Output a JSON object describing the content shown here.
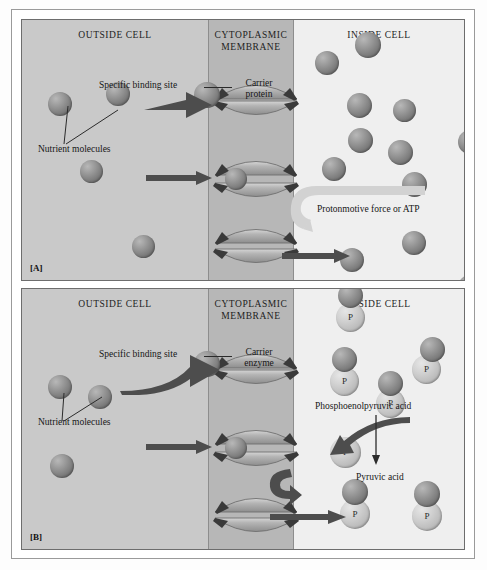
{
  "figure": {
    "panels": [
      {
        "tag": "[A]",
        "zones": {
          "outside": "OUTSIDE CELL",
          "membrane_line1": "CYTOPLASMIC",
          "membrane_line2": "MEMBRANE",
          "inside": "INSIDE CELL"
        },
        "labels": {
          "binding_site": "Specific binding site",
          "carrier_line1": "Carrier",
          "carrier_line2": "protein",
          "nutrient": "Nutrient molecules",
          "energy": "Protonmotive force or ATP"
        }
      },
      {
        "tag": "[B]",
        "zones": {
          "outside": "OUTSIDE CELL",
          "membrane_line1": "CYTOPLASMIC",
          "membrane_line2": "MEMBRANE",
          "inside": "INSIDE CELL"
        },
        "labels": {
          "binding_site": "Specific binding site",
          "carrier_line1": "Carrier",
          "carrier_line2": "enzyme",
          "nutrient": "Nutrient molecules",
          "pep": "Phosphoenolpyruvic acid",
          "pyruvic": "Pyruvic acid"
        }
      }
    ],
    "phosphate_glyph": "P",
    "colors": {
      "outside_zone": "#c9c9c9",
      "membrane_zone": "#b7b7b7",
      "inside_zone": "#efefef",
      "sphere": "#8a8a8a",
      "phosphate_sphere": "#c9c9c9",
      "carrier": "#a5a5a5",
      "binding_notch": "#3a3a3a",
      "arrow": "#4a4a4a",
      "text": "#161616",
      "frame": "#6d6d6d"
    }
  },
  "panelA_spheres_outside": [
    {
      "x": 26,
      "y": 72,
      "d": 24
    },
    {
      "x": 84,
      "y": 62,
      "d": 24
    },
    {
      "x": 58,
      "y": 140,
      "d": 23
    },
    {
      "x": 110,
      "y": 215,
      "d": 23
    }
  ],
  "panelA_spheres_inside": [
    {
      "x": 333,
      "y": 12,
      "d": 26
    },
    {
      "x": 293,
      "y": 31,
      "d": 24
    },
    {
      "x": 325,
      "y": 73,
      "d": 25
    },
    {
      "x": 371,
      "y": 79,
      "d": 23
    },
    {
      "x": 326,
      "y": 108,
      "d": 25
    },
    {
      "x": 366,
      "y": 120,
      "d": 25
    },
    {
      "x": 300,
      "y": 137,
      "d": 24
    },
    {
      "x": 380,
      "y": 152,
      "d": 25
    },
    {
      "x": 436,
      "y": 110,
      "d": 24
    },
    {
      "x": 380,
      "y": 211,
      "d": 24
    },
    {
      "x": 318,
      "y": 228,
      "d": 24
    },
    {
      "x": 363,
      "y": 262,
      "d": 24
    },
    {
      "x": 436,
      "y": 255,
      "d": 24
    }
  ],
  "panelB_spheres_outside": [
    {
      "x": 26,
      "y": 86,
      "d": 24
    },
    {
      "x": 66,
      "y": 96,
      "d": 24
    },
    {
      "x": 28,
      "y": 165,
      "d": 24
    }
  ],
  "panelB_pairs_inside": [
    {
      "x": 316,
      "y": -6,
      "d": 25,
      "px": 314,
      "py": 14,
      "pd": 29
    },
    {
      "x": 310,
      "y": 58,
      "d": 25,
      "px": 308,
      "py": 78,
      "pd": 29
    },
    {
      "x": 356,
      "y": 82,
      "d": 25,
      "px": 354,
      "py": 100,
      "pd": 29
    },
    {
      "x": 398,
      "y": 48,
      "d": 25,
      "px": 390,
      "py": 66,
      "pd": 29
    },
    {
      "x": 320,
      "y": 190,
      "d": 26,
      "px": 318,
      "py": 210,
      "pd": 30
    },
    {
      "x": 392,
      "y": 192,
      "d": 26,
      "px": 390,
      "py": 212,
      "pd": 30
    }
  ],
  "panelB_free_p": [
    {
      "px": 308,
      "py": 148,
      "pd": 31
    }
  ]
}
